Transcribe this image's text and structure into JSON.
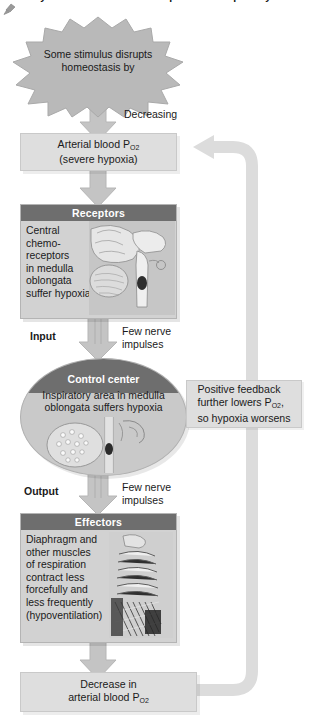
{
  "figure": {
    "title": "ity of the central chemoreceptors and inspiratory area.",
    "pin_icon": "pushpin-icon"
  },
  "colors": {
    "box_fill": "#dedede",
    "panel_fill": "#d2d2d2",
    "header_fill": "#6e6e6e",
    "arrow_fill": "#c4c4c4",
    "loop_fill": "#dcdcdc",
    "text": "#1a1a1a",
    "header_text": "#ffffff"
  },
  "nodes": {
    "stimulus": {
      "shape": "starburst",
      "line1": "Some stimulus disrupts",
      "line2": "homeostasis by"
    },
    "decreasing_label": "Decreasing",
    "arterial": {
      "line1_pre": "Arterial blood P",
      "line1_sub": "O",
      "line1_sub2": "2",
      "line2": "(severe hypoxia)"
    },
    "receptors": {
      "header": "Receptors",
      "text_lines": [
        "Central",
        "chemo-",
        "receptors",
        "in medulla",
        "oblongata",
        "suffer hypoxia"
      ],
      "art": "brain-medulla-sagittal-illustration"
    },
    "input_label": "Input",
    "input_note_line1": "Few nerve",
    "input_note_line2": "impulses",
    "control_center": {
      "header": "Control center",
      "line1": "Inspiratory area in medulla",
      "line2": "oblongata suffers hypoxia",
      "art": "medulla-oblongata-cross-section-illustration"
    },
    "output_label": "Output",
    "output_note_line1": "Few nerve",
    "output_note_line2": "impulses",
    "effectors": {
      "header": "Effectors",
      "text_lines": [
        "Diaphragm and",
        "other muscles",
        "of respiration",
        "contract less",
        "forcefully and",
        "less frequently",
        "(hypoventilation)"
      ],
      "art": "ribcage-respiratory-muscles-illustration"
    },
    "decrease": {
      "line1": "Decrease in",
      "line2_pre": "arterial blood P",
      "line2_sub": "O",
      "line2_sub2": "2"
    },
    "feedback_note": {
      "line1": "Positive feedback",
      "line2_pre": "further lowers P",
      "line2_sub": "O",
      "line2_sub2": "2",
      "line2_post": ",",
      "line3": "so hypoxia worsens"
    }
  },
  "arrows": {
    "stimulus_to_arterial": "down-arrow",
    "arterial_to_receptors": "down-arrow",
    "receptors_to_control": "down-double-arrow",
    "control_to_effectors": "down-double-arrow",
    "effectors_to_decrease": "down-arrow",
    "feedback_loop": "positive-feedback-loop-arrow"
  }
}
